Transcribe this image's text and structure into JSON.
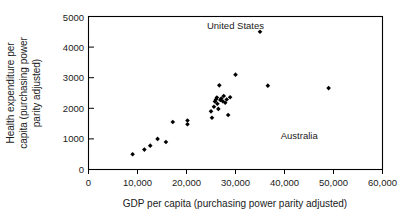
{
  "chart_data": {
    "type": "scatter",
    "title": "",
    "xlabel": "GDP per capita (purchasing power parity adjusted)",
    "ylabel": "Health expenditure per capita (purchasing power parity adjusted)",
    "ylabel_lines": [
      "Health expenditure per",
      "capita (purchasing power",
      "parity adjusted)"
    ],
    "xlim": [
      0,
      60000
    ],
    "ylim": [
      0,
      5000
    ],
    "xticks": [
      0,
      10000,
      20000,
      30000,
      40000,
      50000,
      60000
    ],
    "yticks": [
      0,
      1000,
      2000,
      3000,
      4000,
      5000
    ],
    "xtick_labels": [
      "0",
      "10,000",
      "20,000",
      "30,000",
      "40,000",
      "50,000",
      "60,000"
    ],
    "ytick_labels": [
      "0",
      "1000",
      "2000",
      "3000",
      "4000",
      "5000"
    ],
    "grid": false,
    "legend": "none",
    "marker": "diamond",
    "marker_color": "#000000",
    "points": [
      {
        "x": 9000,
        "y": 500
      },
      {
        "x": 11400,
        "y": 650
      },
      {
        "x": 12600,
        "y": 780
      },
      {
        "x": 14100,
        "y": 1000
      },
      {
        "x": 15800,
        "y": 900
      },
      {
        "x": 17200,
        "y": 1550
      },
      {
        "x": 20200,
        "y": 1600
      },
      {
        "x": 20200,
        "y": 1480
      },
      {
        "x": 25000,
        "y": 1900
      },
      {
        "x": 25200,
        "y": 1690
      },
      {
        "x": 25600,
        "y": 2050
      },
      {
        "x": 25800,
        "y": 2220
      },
      {
        "x": 26000,
        "y": 2290
      },
      {
        "x": 26200,
        "y": 2350
      },
      {
        "x": 26300,
        "y": 2150
      },
      {
        "x": 26500,
        "y": 1980
      },
      {
        "x": 26700,
        "y": 2750
      },
      {
        "x": 26900,
        "y": 2270
      },
      {
        "x": 27100,
        "y": 2320
      },
      {
        "x": 27400,
        "y": 2230
      },
      {
        "x": 27600,
        "y": 2400
      },
      {
        "x": 27900,
        "y": 2180
      },
      {
        "x": 28200,
        "y": 2290
      },
      {
        "x": 28500,
        "y": 1780
      },
      {
        "x": 28900,
        "y": 2360
      },
      {
        "x": 30000,
        "y": 3100
      },
      {
        "x": 35000,
        "y": 4500
      },
      {
        "x": 36600,
        "y": 2740
      },
      {
        "x": 49000,
        "y": 2660
      }
    ],
    "annotations": [
      {
        "label": "United States",
        "x": 30000,
        "y": 4600,
        "points_to": {
          "x": 35000,
          "y": 4500
        }
      },
      {
        "label": "Australia",
        "x": 43000,
        "y": 1000,
        "points_to": null
      }
    ]
  }
}
